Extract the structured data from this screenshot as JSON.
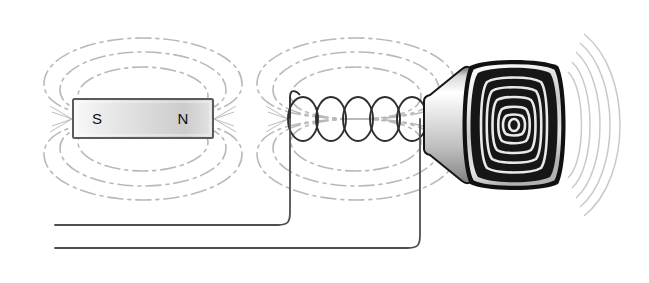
{
  "diagram": {
    "background_color": "#ffffff",
    "magnet": {
      "label": "bar-magnet",
      "south_pole_label": "S",
      "north_pole_label": "N",
      "x": 73,
      "y": 99,
      "width": 140,
      "height": 39,
      "body_light_color": "#f2f2f2",
      "body_mid_color": "#cfcfcf",
      "border_color": "#555555"
    },
    "field_lines": {
      "label": "magnetic-field-lines",
      "color": "#b5b5b5",
      "dash_pattern": "14 5 3 5",
      "loops_per_side": 3,
      "groups": [
        {
          "name": "magnet-field",
          "center_x": 143,
          "center_y": 118
        },
        {
          "name": "coil-field",
          "center_x": 356,
          "center_y": 118
        }
      ]
    },
    "coil": {
      "label": "solenoid-coil",
      "turns": 5,
      "color": "#333333",
      "start_x": 294,
      "end_x": 420,
      "center_y": 119,
      "loop_rx": 15,
      "loop_ry": 22
    },
    "axis": {
      "label": "magnetic-axis",
      "color": "#aaaaaa",
      "y": 119
    },
    "cone": {
      "label": "speaker-cone",
      "light_color": "#ffffff",
      "mid_color": "#c4c4c4",
      "dark_color": "#8f8f8f",
      "border_color": "#111111"
    },
    "speaker": {
      "label": "loudspeaker",
      "outer_rim_color": "#111111",
      "rim_light_color": "#f5f5f5",
      "rim_mid_color": "#9a9a9a",
      "diaphragm_color": "#161616",
      "ring_color": "#e8e8e8",
      "ring_count": 6,
      "center_x": 514,
      "center_y": 125,
      "width": 104,
      "height": 130
    },
    "sound_waves": {
      "label": "sound-waves",
      "color": "#c9c9c9",
      "arc_count": 5,
      "origin_x": 560,
      "origin_y": 125
    },
    "wires": {
      "label": "connection-wires",
      "color": "#555555",
      "top_wire": {
        "start_x": 55,
        "y": 225,
        "corner_x": 290
      },
      "bottom_wire": {
        "start_x": 55,
        "y": 248,
        "corner_x": 420
      }
    }
  }
}
